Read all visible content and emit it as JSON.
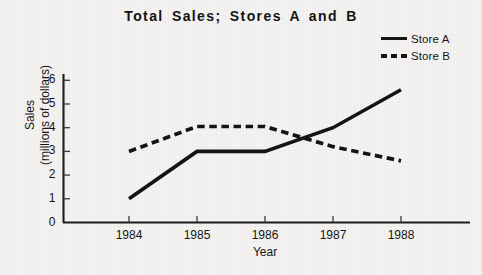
{
  "chart_data": {
    "type": "line",
    "title": "Total Sales; Stores A and B",
    "xlabel": "Year",
    "ylabel": "Sales (millions of dollars)",
    "ylabel_line1": "Sales",
    "ylabel_line2": "(millions of dollars)",
    "categories": [
      "1984",
      "1985",
      "1986",
      "1987",
      "1988"
    ],
    "x": [
      1984,
      1985,
      1986,
      1987,
      1988
    ],
    "xtick_labels": [
      "1984",
      "1985",
      "1986",
      "1987",
      "1988"
    ],
    "ytick_labels": [
      "0",
      "1",
      "2",
      "3",
      "4",
      "5",
      "6"
    ],
    "yticks": [
      0,
      1,
      2,
      3,
      4,
      5,
      6
    ],
    "ylim": [
      0,
      6.4
    ],
    "xlim": [
      1983.65,
      1988.7
    ],
    "grid": false,
    "legend_position": "top-right",
    "series": [
      {
        "name": "Store A",
        "style": "solid",
        "color": "#141414",
        "values": [
          1.0,
          3.0,
          3.0,
          4.0,
          5.6
        ]
      },
      {
        "name": "Store B",
        "style": "dashed",
        "color": "#141414",
        "values": [
          3.0,
          4.05,
          4.05,
          3.2,
          2.6
        ]
      }
    ]
  },
  "legend": {
    "items": [
      {
        "label": "Store A",
        "style": "solid"
      },
      {
        "label": "Store B",
        "style": "dashed"
      }
    ]
  }
}
